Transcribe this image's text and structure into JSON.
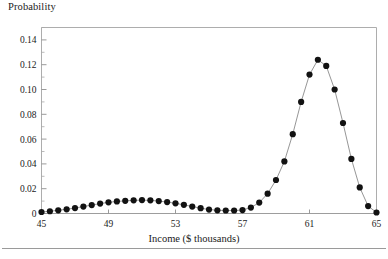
{
  "chart_data": {
    "type": "line",
    "title": "",
    "ylabel": "Probability",
    "xlabel": "Income ($ thousands)",
    "xlim": [
      45,
      65
    ],
    "ylim": [
      0,
      0.15
    ],
    "grid": false,
    "legend": "none",
    "marker": "filled-circle",
    "y_ticks": [
      0,
      0.02,
      0.04,
      0.06,
      0.08,
      0.1,
      0.12,
      0.14
    ],
    "y_tick_labels": [
      "0",
      "0.02",
      "0.04",
      "0.06",
      "0.08",
      "0.10",
      "0.12",
      "0.14"
    ],
    "y_minor_ticks": [
      0.01,
      0.03,
      0.05,
      0.07,
      0.09,
      0.11,
      0.13,
      0.15
    ],
    "x_ticks": [
      45,
      49,
      53,
      57,
      61,
      65
    ],
    "x_tick_labels": [
      "45",
      "49",
      "53",
      "57",
      "61",
      "65"
    ],
    "x": [
      45.0,
      45.5,
      46.0,
      46.5,
      47.0,
      47.5,
      48.0,
      48.5,
      49.0,
      49.5,
      50.0,
      50.5,
      51.0,
      51.5,
      52.0,
      52.5,
      53.0,
      53.5,
      54.0,
      54.5,
      55.0,
      55.5,
      56.0,
      56.5,
      57.0,
      57.5,
      58.0,
      58.5,
      59.0,
      59.5,
      60.0,
      60.5,
      61.0,
      61.5,
      62.0,
      62.5,
      63.0,
      63.5,
      64.0,
      64.5,
      65.0
    ],
    "values": [
      0.0012,
      0.0018,
      0.0026,
      0.0034,
      0.0044,
      0.0056,
      0.0068,
      0.008,
      0.009,
      0.0097,
      0.0102,
      0.0106,
      0.0108,
      0.0106,
      0.01,
      0.0092,
      0.0082,
      0.007,
      0.0056,
      0.0043,
      0.0032,
      0.0026,
      0.0024,
      0.0024,
      0.0028,
      0.0048,
      0.0088,
      0.016,
      0.027,
      0.042,
      0.064,
      0.09,
      0.112,
      0.124,
      0.119,
      0.1,
      0.073,
      0.044,
      0.021,
      0.006,
      0.0008
    ],
    "series_name": "Probability distribution of income",
    "line_color": "#8a8a8a",
    "marker_color": "#121212",
    "frame_color": "#adadad"
  },
  "figure": {
    "ylabel_text": "Probability",
    "xlabel_text": "Income ($ thousands)",
    "footnote_text": ""
  }
}
